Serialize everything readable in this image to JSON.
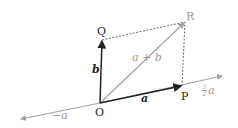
{
  "diagram": {
    "type": "vector-addition-parallelogram",
    "colors": {
      "dark": "#222222",
      "gray": "#a0a0a0"
    },
    "points": {
      "O": {
        "label": "O",
        "x": 100,
        "y": 103
      },
      "P": {
        "label": "P",
        "x": 182,
        "y": 86
      },
      "Q": {
        "label": "Q",
        "x": 102,
        "y": 40
      },
      "R": {
        "label": "R",
        "x": 185,
        "y": 22
      }
    },
    "vectors": {
      "a": {
        "label": "a",
        "from": "O",
        "to": "P"
      },
      "b": {
        "label": "b",
        "from": "O",
        "to": "Q"
      },
      "a_plus_b": {
        "label": "a + b",
        "from": "O",
        "to": "R"
      }
    },
    "axis_labels": {
      "neg_a": "−a",
      "three_halves_num": "3",
      "three_halves_den": "2",
      "three_halves_var": "a"
    }
  }
}
